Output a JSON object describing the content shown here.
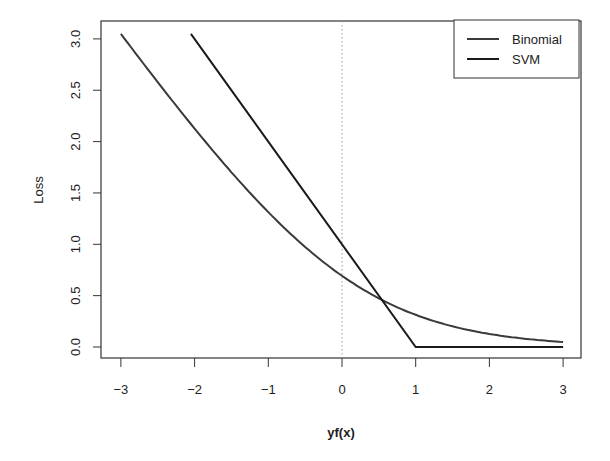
{
  "chart_data": {
    "type": "line",
    "title": "",
    "xlabel": "yf(x)",
    "ylabel": "Loss",
    "xlim": [
      -3,
      3
    ],
    "ylim": [
      0,
      3.0
    ],
    "xticks": [
      "−3",
      "−2",
      "−1",
      "0",
      "1",
      "2",
      "3"
    ],
    "xtick_values": [
      -3,
      -2,
      -1,
      0,
      1,
      2,
      3
    ],
    "yticks": [
      "0.0",
      "0.5",
      "1.0",
      "1.5",
      "2.0",
      "2.5",
      "3.0"
    ],
    "ytick_values": [
      0,
      0.5,
      1.0,
      1.5,
      2.0,
      2.5,
      3.0
    ],
    "grid": false,
    "legend_position": "top-right",
    "annotations": [
      {
        "type": "vertical-dotted-line",
        "x": 0
      }
    ],
    "series": [
      {
        "name": "Binomial",
        "formula": "log(1+exp(-yf))",
        "x": [
          -3,
          -2.5,
          -2,
          -1.5,
          -1,
          -0.5,
          0,
          0.5,
          1,
          1.5,
          2,
          2.5,
          3
        ],
        "values": [
          3.05,
          2.58,
          2.13,
          1.7,
          1.31,
          0.97,
          0.69,
          0.47,
          0.31,
          0.2,
          0.13,
          0.08,
          0.05
        ]
      },
      {
        "name": "SVM",
        "formula": "max(0, 1-yf)",
        "x": [
          -2.05,
          1,
          3
        ],
        "values": [
          3.05,
          0,
          0
        ]
      }
    ]
  },
  "legend": {
    "items": [
      {
        "label": "Binomial"
      },
      {
        "label": "SVM"
      }
    ]
  },
  "axes": {
    "xlabel": "yf(x)",
    "ylabel": "Loss"
  }
}
